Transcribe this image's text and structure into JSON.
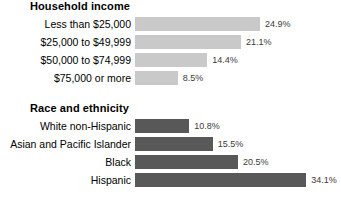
{
  "chart_data": [
    {
      "type": "bar",
      "orientation": "horizontal",
      "title": "Household income",
      "xlabel": "",
      "ylabel": "",
      "grid": false,
      "legend": "none",
      "xlim": [
        0,
        40
      ],
      "value_suffix": "%",
      "bar_color": "#c9c9c9",
      "categories": [
        "Less than $25,000",
        "$25,000 to $49,999",
        "$50,000 to $74,999",
        "$75,000 or more"
      ],
      "values": [
        24.9,
        21.1,
        14.4,
        8.5
      ],
      "value_labels": [
        "24.9%",
        "21.1%",
        "14.4%",
        "8.5%"
      ]
    },
    {
      "type": "bar",
      "orientation": "horizontal",
      "title": "Race and ethnicity",
      "xlabel": "",
      "ylabel": "",
      "grid": false,
      "legend": "none",
      "xlim": [
        0,
        40
      ],
      "value_suffix": "%",
      "bar_color": "#585858",
      "categories": [
        "White non-Hispanic",
        "Asian and Pacific Islander",
        "Black",
        "Hispanic"
      ],
      "values": [
        10.8,
        15.5,
        20.5,
        34.1
      ],
      "value_labels": [
        "10.8%",
        "15.5%",
        "20.5%",
        "34.1%"
      ]
    }
  ]
}
